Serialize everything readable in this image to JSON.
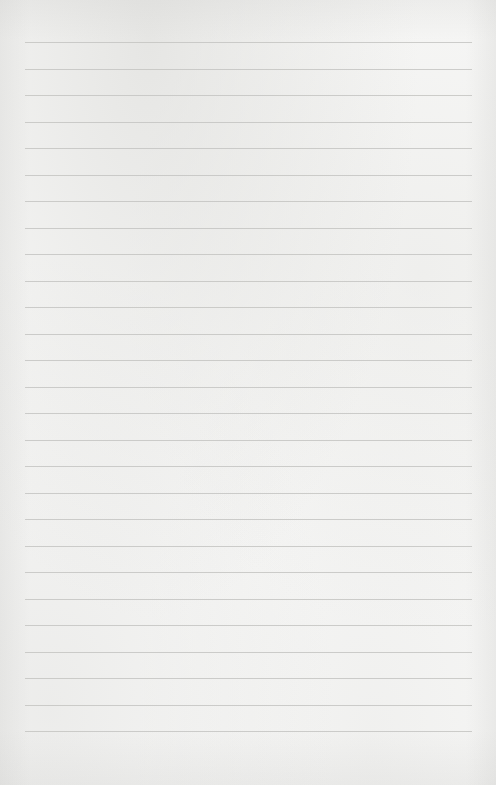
{
  "page": {
    "type": "lined-paper",
    "background_color": "#f8f8f7",
    "line_color": "#c4c4c2",
    "line_count": 27,
    "first_line_y": 42,
    "line_spacing": 26.5,
    "line_left": 25,
    "line_right": 472
  }
}
